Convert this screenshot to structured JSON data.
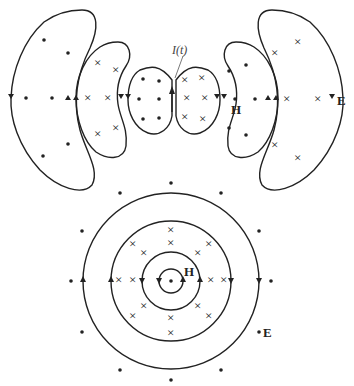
{
  "figure": {
    "type": "electromagnetic field diagram",
    "top_panel": {
      "description": "Radiation field lines of an oscillating dipole, side view",
      "current_label": "I(t)",
      "magnetic_label": "H",
      "electric_label": "E"
    },
    "bottom_panel": {
      "description": "Field pattern viewed along the dipole axis",
      "magnetic_label": "H",
      "electric_label": "E"
    },
    "symbols": {
      "dot": "field out of page",
      "cross": "field into page"
    },
    "colors": {
      "ink": "#222222",
      "background": "#ffffff",
      "label_gray": "#444444"
    }
  }
}
